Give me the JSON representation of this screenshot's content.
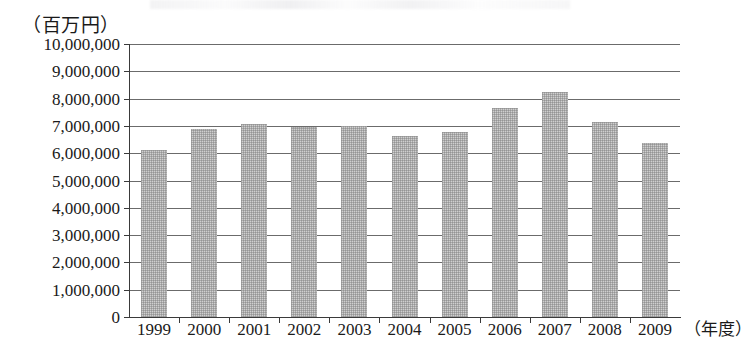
{
  "chart_data": {
    "type": "bar",
    "title": "",
    "subtitle": "",
    "unit_label": "（百万円）",
    "xlabel": "（年度）",
    "ylabel": "",
    "categories": [
      "1999",
      "2000",
      "2001",
      "2002",
      "2003",
      "2004",
      "2005",
      "2006",
      "2007",
      "2008",
      "2009"
    ],
    "values": [
      6130000,
      6880000,
      7080000,
      6950000,
      7000000,
      6630000,
      6760000,
      7650000,
      8250000,
      7150000,
      6370000
    ],
    "series": [
      {
        "name": "",
        "values": [
          6130000,
          6880000,
          7080000,
          6950000,
          7000000,
          6630000,
          6760000,
          7650000,
          8250000,
          7150000,
          6370000
        ]
      }
    ],
    "ylim": [
      0,
      10000000
    ],
    "ytick_values": [
      0,
      1000000,
      2000000,
      3000000,
      4000000,
      5000000,
      6000000,
      7000000,
      8000000,
      9000000,
      10000000
    ],
    "ytick_labels": [
      "0",
      "1,000,000",
      "2,000,000",
      "3,000,000",
      "4,000,000",
      "5,000,000",
      "6,000,000",
      "7,000,000",
      "8,000,000",
      "9,000,000",
      "10,000,000"
    ],
    "grid": true,
    "grid_axis": "y",
    "legend": false,
    "legend_position": "none",
    "bar_color": "#cfcfcf",
    "axis_color": "#3a3a3a",
    "grid_color": "#6b6b6b",
    "annotations": []
  }
}
